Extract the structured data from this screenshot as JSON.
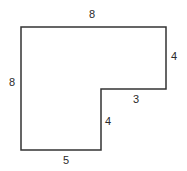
{
  "figure": {
    "type": "L-shaped polygon with side lengths",
    "stroke_color": "#333333",
    "background": "#ffffff"
  },
  "shape": {
    "vertices": [
      [
        21,
        27
      ],
      [
        166,
        27
      ],
      [
        166,
        89
      ],
      [
        101,
        89
      ],
      [
        101,
        150
      ],
      [
        21,
        150
      ]
    ]
  },
  "labels": {
    "top": "8",
    "left": "8",
    "right_upper": "4",
    "inner_horizontal": "3",
    "inner_vertical": "4",
    "bottom": "5"
  }
}
